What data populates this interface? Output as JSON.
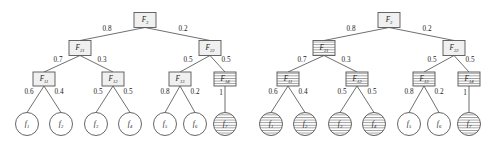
{
  "figure": {
    "type": "two-hierarchical-fuzzy-trees"
  },
  "colors": {
    "node_fill": "#f0f0f0",
    "node_stroke": "#555555",
    "leaf_fill": "#ffffff",
    "edge_stroke": "#4a4a4a",
    "hatch_stroke": "#707070",
    "text": "#1a1a1a",
    "background": "#ffffff"
  },
  "trees": [
    {
      "id": "left-tree",
      "root": {
        "name": "F3",
        "base": "F",
        "sub": "3",
        "hatched": false
      },
      "level2": [
        {
          "name": "F21",
          "base": "F",
          "sub": "21",
          "hatched": false
        },
        {
          "name": "F22",
          "base": "F",
          "sub": "22",
          "hatched": false
        }
      ],
      "level3": [
        {
          "name": "F11",
          "base": "F",
          "sub": "11",
          "hatched": false
        },
        {
          "name": "F12",
          "base": "F",
          "sub": "12",
          "hatched": false
        },
        {
          "name": "F13",
          "base": "F",
          "sub": "13",
          "hatched": false
        },
        {
          "name": "F14",
          "base": "F",
          "sub": "14",
          "hatched": true
        }
      ],
      "leaves": [
        {
          "name": "f1",
          "base": "f",
          "sub": "1",
          "hatched": false
        },
        {
          "name": "f2",
          "base": "f",
          "sub": "2",
          "hatched": false
        },
        {
          "name": "f3",
          "base": "f",
          "sub": "3",
          "hatched": false
        },
        {
          "name": "f4",
          "base": "f",
          "sub": "4",
          "hatched": false
        },
        {
          "name": "f5",
          "base": "f",
          "sub": "5",
          "hatched": false
        },
        {
          "name": "f6",
          "base": "f",
          "sub": "6",
          "hatched": false
        },
        {
          "name": "f7",
          "base": "f",
          "sub": "7",
          "hatched": true
        }
      ],
      "weights_root": [
        "0.8",
        "0.2"
      ],
      "weights_level2": [
        "0.7",
        "0.3",
        "0.5",
        "0.5"
      ],
      "weights_level3": [
        "0.6",
        "0.4",
        "0.5",
        "0.5",
        "0.8",
        "0.2",
        "1"
      ]
    },
    {
      "id": "right-tree",
      "root": {
        "name": "F3",
        "base": "F",
        "sub": "3",
        "hatched": false
      },
      "level2": [
        {
          "name": "F21",
          "base": "F",
          "sub": "21",
          "hatched": true
        },
        {
          "name": "F22",
          "base": "F",
          "sub": "22",
          "hatched": false
        }
      ],
      "level3": [
        {
          "name": "F11",
          "base": "F",
          "sub": "11",
          "hatched": true
        },
        {
          "name": "F12",
          "base": "F",
          "sub": "12",
          "hatched": true
        },
        {
          "name": "F13",
          "base": "F",
          "sub": "13",
          "hatched": true
        },
        {
          "name": "F14",
          "base": "F",
          "sub": "14",
          "hatched": true
        }
      ],
      "leaves": [
        {
          "name": "f1",
          "base": "f",
          "sub": "1",
          "hatched": true
        },
        {
          "name": "f2",
          "base": "f",
          "sub": "2",
          "hatched": true
        },
        {
          "name": "f3",
          "base": "f",
          "sub": "3",
          "hatched": true
        },
        {
          "name": "f4",
          "base": "f",
          "sub": "4",
          "hatched": true
        },
        {
          "name": "f5",
          "base": "f",
          "sub": "5",
          "hatched": false
        },
        {
          "name": "f6",
          "base": "f",
          "sub": "6",
          "hatched": false
        },
        {
          "name": "f7",
          "base": "f",
          "sub": "7",
          "hatched": true
        }
      ],
      "weights_root": [
        "0.8",
        "0.2"
      ],
      "weights_level2": [
        "0.7",
        "0.3",
        "0.5",
        "0.5"
      ],
      "weights_level3": [
        "0.6",
        "0.4",
        "0.5",
        "0.5",
        "0.8",
        "0.2",
        "1"
      ]
    }
  ]
}
